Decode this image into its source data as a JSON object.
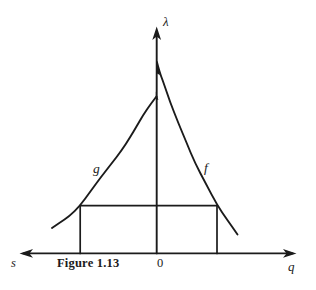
{
  "figure": {
    "caption": "Figure 1.13",
    "background": "#ffffff",
    "ink": "#1b1b1b"
  },
  "labels": {
    "y_axis": "λ",
    "x_axis_left": "s",
    "x_axis_right": "q",
    "origin": "0",
    "left_curve": "g",
    "right_curve": "f"
  },
  "geometry": {
    "x_axis": {
      "y": 253.4,
      "x_tip_left": 19.5,
      "x_tip_right": 296.5
    },
    "y_axis": {
      "x": 156.7,
      "y_tip": 26.5,
      "y_bottom": 253.4
    },
    "rect": {
      "left": 80.2,
      "right": 217,
      "top": 205.6,
      "bottom": 253.4
    },
    "arrow": {
      "length": 13.5,
      "half_width": 4.4,
      "notch": 10
    },
    "curve_g": [
      [
        156.4,
        96.5
      ],
      [
        150,
        105
      ],
      [
        143.2,
        115
      ],
      [
        136.8,
        126
      ],
      [
        130,
        137.5
      ],
      [
        121.5,
        150.5
      ],
      [
        112,
        163
      ],
      [
        101,
        177
      ],
      [
        90,
        192
      ],
      [
        80.2,
        205.6
      ],
      [
        69,
        216.5
      ],
      [
        60,
        222.5
      ],
      [
        52,
        228
      ]
    ],
    "curve_f": [
      [
        156.9,
        62
      ],
      [
        159.5,
        72
      ],
      [
        163.3,
        82
      ],
      [
        170,
        102
      ],
      [
        178.3,
        123
      ],
      [
        186.7,
        143
      ],
      [
        195,
        163
      ],
      [
        206,
        184
      ],
      [
        217,
        204.8
      ],
      [
        227,
        219.5
      ],
      [
        237.5,
        234.5
      ]
    ],
    "f_junction_blob": [
      [
        156.0,
        58
      ],
      [
        160.0,
        75
      ],
      [
        156.0,
        73
      ]
    ],
    "g_junction_blob": [
      [
        155.8,
        91.5
      ],
      [
        158.4,
        100
      ],
      [
        155.8,
        99
      ]
    ]
  }
}
